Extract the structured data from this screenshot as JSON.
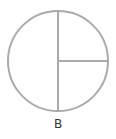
{
  "diagram": {
    "label": "B",
    "shape": "circle",
    "divisions": [
      "half",
      "quarter",
      "quarter"
    ],
    "stroke_color": "#aaaaaa",
    "label_color": "#333333"
  }
}
